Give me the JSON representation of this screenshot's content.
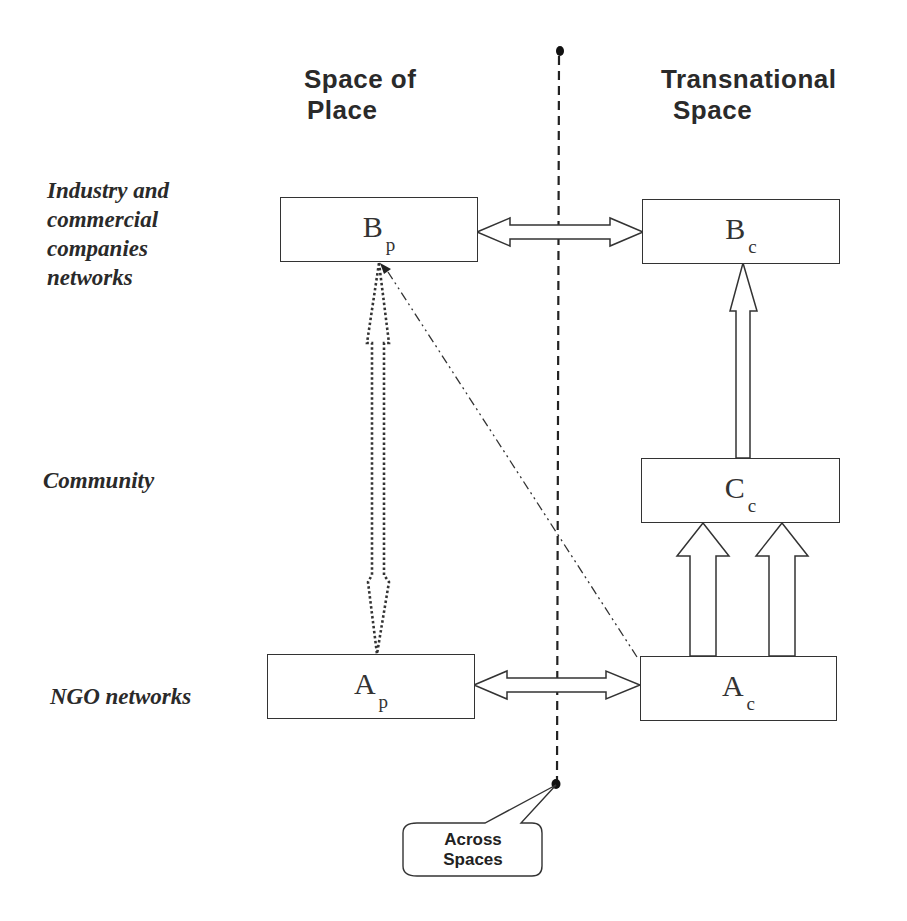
{
  "columns": {
    "left": {
      "line1": "Space of",
      "line2": "Place"
    },
    "right": {
      "line1": "Transnational",
      "line2": "Space"
    }
  },
  "rows": {
    "industry": {
      "line1": "Industry and",
      "line2": "commercial",
      "line3": "companies",
      "line4": "networks"
    },
    "community": {
      "line1": "Community"
    },
    "ngo": {
      "line1": "NGO networks"
    }
  },
  "nodes": {
    "bp": {
      "main": "B",
      "sub": "p"
    },
    "bc": {
      "main": "B",
      "sub": "c"
    },
    "cc": {
      "main": "C",
      "sub": "c"
    },
    "ap": {
      "main": "A",
      "sub": "p"
    },
    "ac": {
      "main": "A",
      "sub": "c"
    }
  },
  "divider": {
    "callout": {
      "line1": "Across",
      "line2": "Spaces"
    }
  },
  "edges": [
    {
      "from": "Bp",
      "to": "Bc",
      "style": "double-headed hollow arrow"
    },
    {
      "from": "Ap",
      "to": "Ac",
      "style": "double-headed hollow arrow"
    },
    {
      "from": "Ap",
      "to": "Bp",
      "style": "double-headed dotted hollow arrow"
    },
    {
      "from": "Cc",
      "to": "Bc",
      "style": "hollow arrow"
    },
    {
      "from": "Ac",
      "to": "Cc",
      "style": "two hollow arrows"
    },
    {
      "from": "Ac",
      "to": "Bp",
      "style": "dash-dot line with arrowhead"
    }
  ],
  "colors": {
    "stroke": "#333333",
    "text": "#2a2a2a",
    "background": "#ffffff"
  }
}
